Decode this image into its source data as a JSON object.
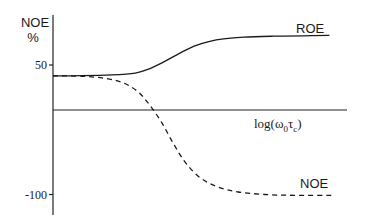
{
  "chart_data": {
    "type": "line",
    "title": "",
    "ylabel_line1": "NOE",
    "ylabel_line2": "%",
    "xlabel": "log(ω0τc)",
    "xlabel_parts": {
      "base": "log(ω",
      "sub1": "0",
      "mid": "τ",
      "sub2": "c",
      "end": ")"
    },
    "ylim": [
      -120,
      105
    ],
    "xlim": [
      0,
      10
    ],
    "y_ticks": [
      {
        "value": 50,
        "label": "50"
      },
      {
        "value": -100,
        "label": "-100"
      }
    ],
    "x_ticks": [],
    "grid": false,
    "zero_line": true,
    "series": [
      {
        "name": "ROE",
        "style": "solid",
        "color": "#1a1a1a",
        "x": [
          0,
          1,
          2,
          2.8,
          3.3,
          3.8,
          4.3,
          4.8,
          5.3,
          5.8,
          6.5,
          7.5,
          8.5,
          9.4
        ],
        "y": [
          38,
          38.2,
          39,
          41,
          46,
          54,
          63,
          71,
          76,
          79,
          81,
          82,
          82.5,
          83
        ]
      },
      {
        "name": "NOE",
        "style": "dashed",
        "color": "#1a1a1a",
        "x": [
          0,
          1,
          1.8,
          2.4,
          2.9,
          3.3,
          3.7,
          4.1,
          4.5,
          5.0,
          5.6,
          6.3,
          7.2,
          8.2,
          9.6
        ],
        "y": [
          38,
          37.5,
          35,
          30,
          20,
          5,
          -15,
          -40,
          -62,
          -80,
          -91,
          -97,
          -100,
          -101,
          -101
        ]
      }
    ],
    "annotations": [
      {
        "text": "ROE",
        "series": "ROE"
      },
      {
        "text": "NOE",
        "series": "NOE"
      }
    ]
  }
}
